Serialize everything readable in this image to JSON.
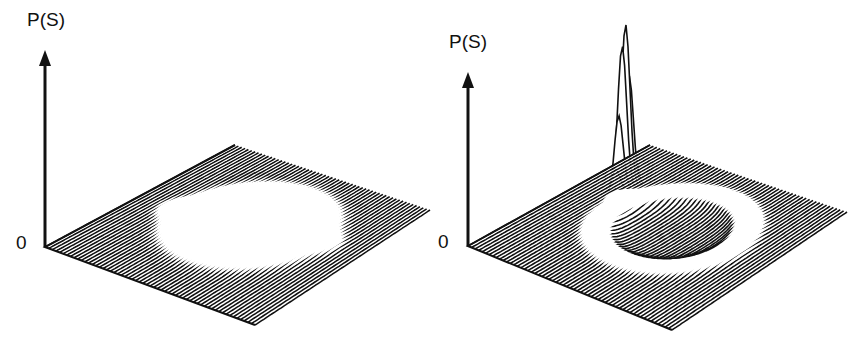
{
  "figure": {
    "panels": [
      {
        "id": "left",
        "y_axis_label": "P(S)",
        "origin_label": "0",
        "description": "3D mesh surface: flat base with raised circular ring-shaped rim (crater) and small bumps at the ring's left and right edges"
      },
      {
        "id": "right",
        "y_axis_label": "P(S)",
        "origin_label": "0",
        "description": "3D mesh surface: flat base with a circular depression/ring and a single tall sharp peak at the left edge of the ring"
      }
    ],
    "colors": {
      "ink": "#111111",
      "background": "#ffffff"
    }
  },
  "chart_data": [
    {
      "type": "surface",
      "title": "",
      "zlabel": "P(S)",
      "z_origin_tick": "0",
      "features": [
        "circular ring/plateau",
        "two small side bumps"
      ],
      "grid": false
    },
    {
      "type": "surface",
      "title": "",
      "zlabel": "P(S)",
      "z_origin_tick": "0",
      "features": [
        "circular ring",
        "one tall narrow peak on left side of ring"
      ],
      "grid": false
    }
  ]
}
